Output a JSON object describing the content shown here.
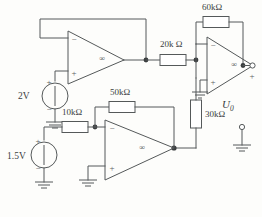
{
  "diagram": {
    "type": "schematic",
    "background_color": "#fdfdfb",
    "wire_color": "#55595a"
  },
  "sources": [
    {
      "id": "v1",
      "label": "2V",
      "polarity_top": "+",
      "polarity_bottom": "−",
      "connects_to": "U1 non-inverting input"
    },
    {
      "id": "v2",
      "label": "1.5V",
      "polarity_top": "+",
      "polarity_bottom": "−",
      "connects_to": "10kΩ resistor"
    }
  ],
  "resistors": [
    {
      "id": "r1",
      "label": "10kΩ",
      "orientation": "horizontal"
    },
    {
      "id": "r2",
      "label": "50kΩ",
      "orientation": "horizontal"
    },
    {
      "id": "r3",
      "label": "20k Ω",
      "orientation": "horizontal"
    },
    {
      "id": "r4",
      "label": "60kΩ",
      "orientation": "horizontal"
    },
    {
      "id": "r5",
      "label": "30kΩ",
      "orientation": "vertical"
    }
  ],
  "opamps": [
    {
      "id": "U1",
      "symbol": "∞",
      "minus": "−",
      "plus": "+",
      "role": "voltage follower"
    },
    {
      "id": "U2",
      "symbol": "∞",
      "minus": "−",
      "plus": "+",
      "role": "inverting amplifier"
    },
    {
      "id": "U3",
      "symbol": "∞",
      "minus": "−",
      "plus": "+",
      "role": "inverting summing amplifier"
    }
  ],
  "output": {
    "name": "U",
    "subscript": "0",
    "terminal_plus": "+",
    "terminal_minus": "−"
  }
}
